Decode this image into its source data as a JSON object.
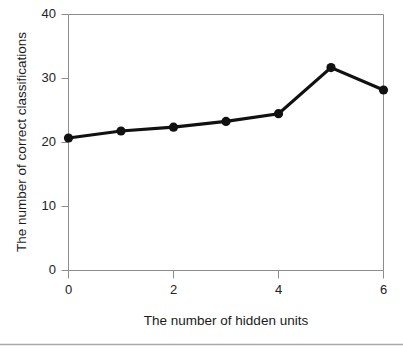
{
  "figure": {
    "name": "line-chart-hidden-units-vs-correct-classifications",
    "background_color": "#ffffff",
    "axis_color": "#8d8d8d",
    "line_color": "#111111",
    "bottom_rule_color": "#a9a9a9"
  },
  "chart_data": {
    "type": "line",
    "title": "",
    "subtitle": "",
    "xlabel": "The number of hidden units",
    "ylabel": "The number of correct classifications",
    "x": [
      0,
      1,
      2,
      3,
      4,
      5,
      6
    ],
    "values": [
      20.7,
      21.8,
      22.4,
      23.3,
      24.5,
      31.7,
      28.2
    ],
    "series": [
      {
        "name": "The number of correct classifications",
        "values": [
          20.7,
          21.8,
          22.4,
          23.3,
          24.5,
          31.7,
          28.2
        ]
      }
    ],
    "xlim": [
      0,
      6
    ],
    "ylim": [
      0,
      40
    ],
    "xticks": [
      0,
      1,
      2,
      3,
      4,
      5,
      6
    ],
    "xtick_labels": [
      "0",
      "",
      "2",
      "",
      "4",
      "",
      "6"
    ],
    "yticks": [
      0,
      10,
      20,
      30,
      40
    ],
    "ytick_labels": [
      "0",
      "10",
      "20",
      "30",
      "40"
    ],
    "grid": false,
    "legend": false,
    "legend_position": "none",
    "marker": "circle",
    "annotations": []
  }
}
